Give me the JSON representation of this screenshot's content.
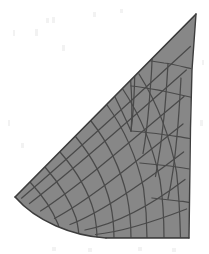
{
  "figure": {
    "name": "structured-computational-mesh",
    "title": "Structured computational mesh over wedge-type domain",
    "width": 209,
    "height": 254
  },
  "colors": {
    "background": "#ffffff",
    "domain_fill": "#878787",
    "grid_line": "#4a4a4a",
    "boundary_line": "#3d3d3d",
    "noise": "#f4f4f4"
  },
  "style": {
    "grid_line_width": 1.25,
    "boundary_line_width": 1.4
  },
  "chart_data": {
    "type": "diagram",
    "subtype": "structured-grid-mesh",
    "title": "Structured computational mesh over wedge-type domain",
    "xlabel": "",
    "ylabel": "",
    "grid": true,
    "legend": false,
    "xlim": [
      0,
      209
    ],
    "ylim": [
      0,
      254
    ],
    "counts": {
      "streamwise_cells_lower_block": 7,
      "normal_cells_right_edge": 8,
      "singular_branch_points": 1
    },
    "key_points": {
      "leading_edge_tip": [
        15,
        197
      ],
      "top_apex": [
        196,
        14
      ],
      "bottom_right_corner": [
        189,
        238
      ],
      "lower_curve_end": [
        106,
        238
      ],
      "branch_point": [
        131,
        131
      ]
    },
    "boundaries": [
      {
        "name": "upper-diagonal-boundary",
        "type": "polyline",
        "points": [
          [
            15,
            197
          ],
          [
            196,
            14
          ]
        ]
      },
      {
        "name": "right-boundary",
        "type": "polyline",
        "points": [
          [
            196,
            14
          ],
          [
            190,
            128
          ],
          [
            189,
            238
          ]
        ]
      },
      {
        "name": "lower-horizontal-boundary",
        "type": "polyline",
        "points": [
          [
            189,
            238
          ],
          [
            106,
            238
          ]
        ]
      },
      {
        "name": "lower-left-concave-boundary",
        "type": "cubic",
        "points": [
          [
            106,
            238
          ],
          [
            72,
            236
          ],
          [
            36,
            221
          ],
          [
            15,
            197
          ]
        ]
      }
    ]
  },
  "mesh": {
    "domain_outline": "M 15 197 L 196 14 L 192 70 L 190 128 L 189 238 L 106 238 C 72 236 36 221 15 197 Z",
    "j_lines": [
      "M 15 197 L 196 14",
      "M 21.5 198.2 C 62 164 118 113 190.4 46.5",
      "M 29.5 203.5 C 68 174 122 127 186.3 70.0",
      "M 40.5 211.0 C 76 188 124 147 184.0 96.5",
      "M 54.5 218.5 C 86 202 128 168 183.0 124.0",
      "M 70.0 224.5 C 98 214 134 190 183.6 152.0",
      "M 85.0 230.0 C 110 225 145 210 185.0 179.5",
      "M 95.5 234.5 C 120 232 153 222 186.6 209.0",
      "M 106 238 L 189 238"
    ],
    "i_lines_lower_block": [
      "M 15 197 C 26 207 32 215 40.5 229.5 C 43 233 44 236 44.5 238.6",
      "M 30.0 182.0 C 43 196 52 209 58.0 224.0 C 60 230 61 235 61.5 238.6",
      "M 45.0 167.0 C 58 182 70 200 76.0 218.0 C 78 226 79 233 79.0 238.6",
      "M 60.0 152.0 C 74 168 88 190 94.0 212.0 C 96 222 97 232 97.0 238.6",
      "M 75.5 136.5 C 90 154 104 178 110.5 204.0 C 113 216 114 230 114.0 238.6",
      "M 91.0 121.0 C 106 140 120 166 127.0 196.0 C 130 211 131 228 131.0 238.6",
      "M 107.0 105.0 C 122 126 136 154 143.5 188.0 C 146 206 147 224 147.0 238.6",
      "M 123.0 89.5 C 138 112 152 142 160.0 180.0 C 163 200 164 220 164.0 238.6",
      "M 139.0 74.0 C 154 98 169 130 176.5 172.0 C 179 194 180 218 180.5 238.6"
    ],
    "i_lines_upper_block": [
      "M 131.0 131.0 C 133 116 134 100 134.5 84.0 C 135 70 135 56 135.0 41.0",
      "M 143.0 153.5 C 146 137 148 118 149.5 99.0 C 151 82 152 66 152.5 50.5",
      "M 155.5 176.5 C 159 158 162 138 164.0 117.0 C 166 98 167 80 168.0 63.5",
      "M 168.0 199.0 C 172 180 175 158 177.0 136.0 C 179 115 180 96 181.0 78.0"
    ],
    "i_lines_singular_fan": [
      "M 131.0 131.0 C 132 119 132 107 131.5 95.0 C 131 83 130 71 129.0 59.0",
      "M 131.0 131.0 C 126 120 121 109 115.5 98.0 C 110 88 105 78 100.0 68.0"
    ],
    "j_lines_upper_block": [
      "M 128.0 57.5 C 140 59 152 61 164.0 63.0 C 172 64 180 66 190.8 68.5",
      "M 131.0 86.0 C 142 87 152 89 163.0 91.0 C 172 93 181 95 190.2 97.0",
      "M 131.0 131.0 C 142 132 152 133 163.0 134.5 C 172 136 181 137 189.8 138.5",
      "M 140.0 163.0 C 150 164 160 165 170.0 166.0 C 177 167 184 168 189.6 169.0",
      "M 152.0 198.0 C 161 199 170 200 178.5 201.0 C 183 201 187 202 189.4 202.5"
    ],
    "boundary_paths": [
      "M 15 197 L 196 14",
      "M 196 14 L 192 70 L 190.5 128 L 189 238",
      "M 189 238 L 106 238",
      "M 106 238 C 72 236 36 221 15 197"
    ]
  },
  "noise_specks": [
    {
      "x": 46,
      "y": 18,
      "w": 3,
      "h": 5
    },
    {
      "x": 52,
      "y": 17,
      "w": 3,
      "h": 6
    },
    {
      "x": 13,
      "y": 30,
      "w": 2,
      "h": 6
    },
    {
      "x": 35,
      "y": 29,
      "w": 3,
      "h": 7
    },
    {
      "x": 62,
      "y": 45,
      "w": 3,
      "h": 6
    },
    {
      "x": 93,
      "y": 12,
      "w": 3,
      "h": 5
    },
    {
      "x": 120,
      "y": 9,
      "w": 3,
      "h": 4
    },
    {
      "x": 8,
      "y": 120,
      "w": 2,
      "h": 6
    },
    {
      "x": 21,
      "y": 143,
      "w": 3,
      "h": 5
    },
    {
      "x": 52,
      "y": 247,
      "w": 4,
      "h": 4
    },
    {
      "x": 88,
      "y": 248,
      "w": 4,
      "h": 4
    },
    {
      "x": 138,
      "y": 247,
      "w": 4,
      "h": 4
    },
    {
      "x": 172,
      "y": 248,
      "w": 4,
      "h": 4
    },
    {
      "x": 200,
      "y": 120,
      "w": 3,
      "h": 6
    },
    {
      "x": 202,
      "y": 60,
      "w": 2,
      "h": 5
    }
  ]
}
